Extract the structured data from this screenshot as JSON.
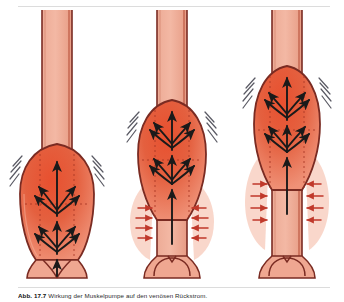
{
  "figure": {
    "panel_count": 3,
    "background_color": "#ffffff",
    "rule_color": "#dcdcdc"
  },
  "colors": {
    "vessel_wall_outline": "#7a2b22",
    "vessel_lumen_light": "#f0a691",
    "vessel_lumen_mid": "#eb9b86",
    "bulge_red_dark": "#e0452c",
    "bulge_red_mid": "#e9613f",
    "bulge_red_light": "#f08f74",
    "arrow_black": "#1a1a1a",
    "arrow_red": "#c0392b",
    "dotted_guide": "#b03a28",
    "vibration_gray": "#5a5a64",
    "pale_wall_tissue": "#f7cbbd"
  },
  "panels": [
    {
      "id": "panel-1",
      "name": "competent-valve-low-dilation",
      "label": "a",
      "vessel": {
        "tube_top_y": 8,
        "bulge_top_y": 140,
        "bulge_bottom_y": 250,
        "bulge_max_width": 76,
        "tube_width": 30
      },
      "valve": {
        "state": "open",
        "cusps": 2
      },
      "flow_arrows": {
        "central_count": 3,
        "fan_tiers": 2,
        "fan_per_tier": 4,
        "direction": "upward"
      },
      "wall_arrows": {
        "count": 0,
        "color": "#c0392b"
      },
      "vibration_marks": {
        "left": 4,
        "right": 4
      }
    },
    {
      "id": "panel-2",
      "name": "mid-dilation-wall-pressure",
      "label": "b",
      "vessel": {
        "tube_top_y": 8,
        "bulge_top_y": 96,
        "bulge_bottom_y": 218,
        "bulge_max_width": 72,
        "tube_width": 30
      },
      "valve": {
        "state": "closed",
        "cusps": 2
      },
      "flow_arrows": {
        "central_count": 3,
        "fan_tiers": 2,
        "fan_per_tier": 4,
        "direction": "upward"
      },
      "wall_arrows": {
        "count": 8,
        "color": "#c0392b"
      },
      "vibration_marks": {
        "left": 4,
        "right": 4
      }
    },
    {
      "id": "panel-3",
      "name": "high-dilation-valve-incompetence",
      "label": "c",
      "vessel": {
        "tube_top_y": 8,
        "bulge_top_y": 62,
        "bulge_bottom_y": 186,
        "bulge_max_width": 70,
        "tube_width": 30
      },
      "valve": {
        "state": "closed",
        "cusps": 2
      },
      "flow_arrows": {
        "central_count": 3,
        "fan_tiers": 2,
        "fan_per_tier": 4,
        "direction": "upward"
      },
      "wall_arrows": {
        "count": 8,
        "color": "#c0392b"
      },
      "vibration_marks": {
        "left": 4,
        "right": 4
      }
    }
  ],
  "caption": {
    "number": "Abb. 17.7",
    "text": "Wirkung der Muskelpumpe auf den venösen Rückstrom.",
    "truncated": true
  }
}
